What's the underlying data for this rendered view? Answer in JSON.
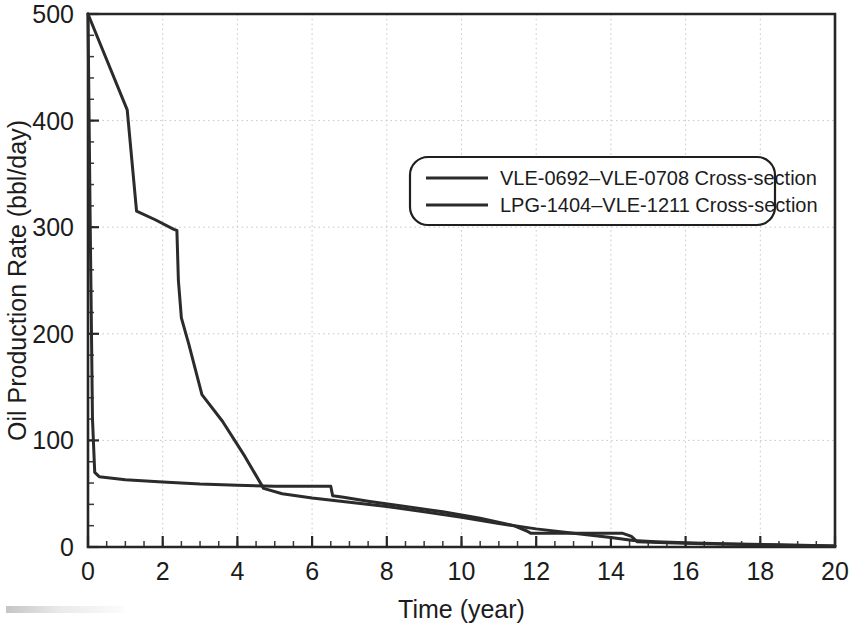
{
  "chart_data": {
    "type": "line",
    "title": "",
    "xlabel": "Time (year)",
    "ylabel": "Oil Production Rate (bbl/day)",
    "xlim": [
      0,
      20
    ],
    "ylim": [
      0,
      500
    ],
    "xticks": [
      0,
      2,
      4,
      6,
      8,
      10,
      12,
      14,
      16,
      18,
      20
    ],
    "yticks": [
      0,
      100,
      200,
      300,
      400,
      500
    ],
    "xtick_labels": [
      "0",
      "2",
      "4",
      "6",
      "8",
      "10",
      "12",
      "14",
      "16",
      "18",
      "20"
    ],
    "ytick_labels": [
      "0",
      "100",
      "200",
      "300",
      "400",
      "500"
    ],
    "x_minor_interval": 0.5,
    "y_minor_interval": 20,
    "grid": true,
    "grid_style": "dotted",
    "grid_color": "#c9c9c9",
    "legend_position": "upper-right-inset",
    "series": [
      {
        "name": "VLE-0692–VLE-0708 Cross-section",
        "color": "#2b2b2b",
        "points": [
          [
            0.0,
            500
          ],
          [
            0.06,
            300
          ],
          [
            0.12,
            120
          ],
          [
            0.18,
            70
          ],
          [
            0.3,
            66
          ],
          [
            1.0,
            63
          ],
          [
            2.0,
            61
          ],
          [
            3.0,
            59
          ],
          [
            4.0,
            58
          ],
          [
            5.0,
            57
          ],
          [
            6.0,
            57
          ],
          [
            6.5,
            57
          ],
          [
            6.55,
            48
          ],
          [
            6.8,
            47
          ],
          [
            7.5,
            43
          ],
          [
            8.5,
            38
          ],
          [
            9.5,
            33
          ],
          [
            10.5,
            27
          ],
          [
            11.4,
            20
          ],
          [
            11.75,
            15
          ],
          [
            11.85,
            13
          ],
          [
            12.5,
            13
          ],
          [
            13.5,
            13
          ],
          [
            14.3,
            13
          ],
          [
            14.55,
            10
          ],
          [
            14.7,
            5
          ],
          [
            15.5,
            4
          ],
          [
            16.5,
            3
          ],
          [
            18.0,
            2
          ],
          [
            20.0,
            1
          ]
        ]
      },
      {
        "name": "LPG-1404–VLE-1211 Cross-section",
        "color": "#2b2b2b",
        "points": [
          [
            0.0,
            500
          ],
          [
            0.35,
            470
          ],
          [
            1.05,
            410
          ],
          [
            1.3,
            315
          ],
          [
            1.8,
            307
          ],
          [
            2.3,
            298
          ],
          [
            2.38,
            297
          ],
          [
            2.42,
            250
          ],
          [
            2.5,
            215
          ],
          [
            2.7,
            190
          ],
          [
            3.05,
            143
          ],
          [
            3.6,
            118
          ],
          [
            4.2,
            85
          ],
          [
            4.7,
            55
          ],
          [
            5.2,
            50
          ],
          [
            6.0,
            46
          ],
          [
            7.0,
            42
          ],
          [
            8.0,
            38
          ],
          [
            9.0,
            33
          ],
          [
            10.0,
            28
          ],
          [
            11.0,
            22
          ],
          [
            12.0,
            17
          ],
          [
            13.0,
            13
          ],
          [
            14.0,
            9
          ],
          [
            14.6,
            6
          ],
          [
            15.2,
            5
          ],
          [
            16.0,
            4
          ],
          [
            17.0,
            3
          ],
          [
            18.5,
            2
          ],
          [
            20.0,
            1
          ]
        ]
      }
    ]
  },
  "legend": {
    "entries": [
      {
        "label": "VLE-0692–VLE-0708 Cross-section"
      },
      {
        "label": "LPG-1404–VLE-1211 Cross-section"
      }
    ]
  },
  "axes": {
    "x_title": "Time (year)",
    "y_title": "Oil Production Rate (bbl/day)"
  }
}
